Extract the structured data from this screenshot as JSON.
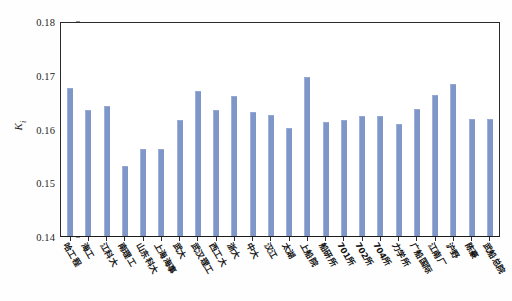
{
  "chart_data": {
    "type": "bar",
    "title": "",
    "xlabel": "",
    "ylabel": "K",
    "ylabel_sub": "i",
    "ylim": [
      0.14,
      0.18
    ],
    "yticks": [
      "0.14",
      "0.15",
      "0.16",
      "0.17",
      "0.18"
    ],
    "ytick_values": [
      0.14,
      0.15,
      0.16,
      0.17,
      0.18
    ],
    "grid": false,
    "legend": "none",
    "bar_color": "#7e97c8",
    "categories": [
      "哈工程",
      "海工",
      "江科大",
      "南理工",
      "山东科大",
      "上海海事",
      "武大",
      "武汉理工",
      "西工大",
      "浙大",
      "中大",
      "汉江",
      "太湖",
      "上船院",
      "船研所",
      "701所",
      "702所",
      "704所",
      "力学所",
      "广船国际",
      "江南厂",
      "沪野",
      "陈豪",
      "武船总院"
    ],
    "values": [
      0.1676,
      0.1635,
      0.1643,
      0.153,
      0.1563,
      0.1562,
      0.1616,
      0.1671,
      0.1636,
      0.1661,
      0.1631,
      0.1627,
      0.1601,
      0.1697,
      0.1614,
      0.1617,
      0.1625,
      0.1624,
      0.161,
      0.1638,
      0.1663,
      0.1684,
      0.1618,
      0.1618
    ]
  }
}
